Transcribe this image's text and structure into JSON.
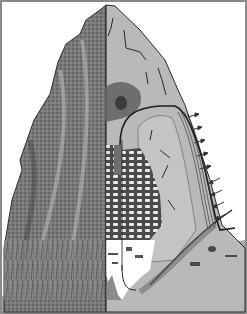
{
  "illustration": {
    "subject": "termite-mound-cross-section",
    "width": 247,
    "height": 314,
    "colors": {
      "background": "#ffffff",
      "frame": "#8a8a8a",
      "exterior_dark": "#5a5a5a",
      "exterior_mid": "#7a7a7a",
      "exterior_light": "#9a9a9a",
      "interior_wall": "#b9b9b9",
      "interior_dark_chamber": "#6e6e6e",
      "nursery_comb": "#4a4a4a",
      "comb_gaps": "#e8e8e8",
      "cellar_void": "#ffffff",
      "ground": "#a9a9a9",
      "duct_line": "#1e1e1e",
      "crack_line": "#2a2a2a",
      "ridge_channels": "#d8d8d8",
      "arrow": "#333333"
    },
    "air_arrows_in": [
      {
        "x": 228,
        "y": 112
      },
      {
        "x": 228,
        "y": 125
      },
      {
        "x": 229,
        "y": 138
      },
      {
        "x": 230,
        "y": 151
      },
      {
        "x": 231,
        "y": 164
      }
    ],
    "air_arrows_out": [
      {
        "x": 232,
        "y": 178
      },
      {
        "x": 233,
        "y": 190
      },
      {
        "x": 234,
        "y": 202
      },
      {
        "x": 236,
        "y": 214
      }
    ]
  }
}
